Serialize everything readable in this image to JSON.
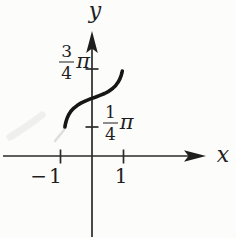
{
  "figure": {
    "background": "#fcfcfb",
    "ink_color": "#1e1e1e",
    "labels": {
      "y_axis": "y",
      "x_axis": "x",
      "x_tick_neg": "−1",
      "x_tick_pos": "1",
      "y_tick_upper": {
        "num": "3",
        "den": "4",
        "pi": "π"
      },
      "y_tick_lower": {
        "num": "1",
        "den": "4",
        "pi": "π"
      }
    }
  },
  "chart_data": {
    "type": "line",
    "title": "",
    "xlabel": "x",
    "ylabel": "y",
    "grid": false,
    "legend": false,
    "xlim": [
      -2.8,
      3.6
    ],
    "ylim_pi": [
      -0.71,
      1.08
    ],
    "x_ticks": [
      -1,
      1
    ],
    "x_tick_labels": [
      "−1",
      "1"
    ],
    "y_ticks_pi": [
      0.75,
      0.25
    ],
    "y_tick_labels": [
      "3/4 π",
      "1/4 π"
    ],
    "series": [
      {
        "name": "curve",
        "description": "Thick hand-drawn S-shaped arc from about (−0.9, π/4) up to about (1, 3π/4), passing through (0, π/2); shallow slope near the middle, steep at both ends (arcsine-like).",
        "points_x_ypi": [
          [
            -0.86,
            0.25
          ],
          [
            -0.845,
            0.275
          ],
          [
            -0.82,
            0.302
          ],
          [
            -0.785,
            0.33
          ],
          [
            -0.735,
            0.358
          ],
          [
            -0.665,
            0.387
          ],
          [
            -0.575,
            0.413
          ],
          [
            -0.465,
            0.437
          ],
          [
            -0.34,
            0.458
          ],
          [
            -0.2,
            0.476
          ],
          [
            -0.05,
            0.492
          ],
          [
            0.1,
            0.507
          ],
          [
            0.25,
            0.522
          ],
          [
            0.4,
            0.539
          ],
          [
            0.53,
            0.558
          ],
          [
            0.645,
            0.58
          ],
          [
            0.745,
            0.606
          ],
          [
            0.825,
            0.635
          ],
          [
            0.885,
            0.665
          ],
          [
            0.928,
            0.696
          ],
          [
            0.952,
            0.72
          ],
          [
            0.962,
            0.733
          ]
        ]
      }
    ]
  }
}
